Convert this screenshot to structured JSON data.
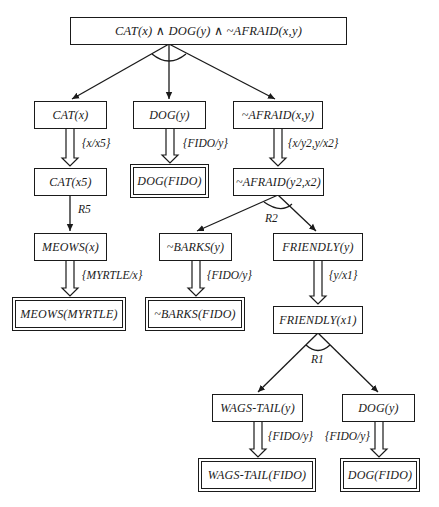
{
  "diagram": {
    "type": "AND/OR proof tree",
    "root": {
      "label": "CAT(x) ∧ DOG(y) ∧ ~AFRAID(x,y)"
    },
    "nodes": {
      "cat_x": "CAT(x)",
      "dog_y": "DOG(y)",
      "afraid_xy": "~AFRAID(x,y)",
      "cat_x5": "CAT(x5)",
      "dog_fido": "DOG(FIDO)",
      "afraid_y2x2": "~AFRAID(y2,x2)",
      "meows_x": "MEOWS(x)",
      "barks_y": "~BARKS(y)",
      "friendly_y": "FRIENDLY(y)",
      "meows_myrtle": "MEOWS(MYRTLE)",
      "barks_fido": "~BARKS(FIDO)",
      "friendly_x1": "FRIENDLY(x1)",
      "wagstail_y": "WAGS-TAIL(y)",
      "dog_y2": "DOG(y)",
      "wagstail_fido": "WAGS-TAIL(FIDO)",
      "dog_fido2": "DOG(FIDO)"
    },
    "substitutions": {
      "x_x5": "{x/x5}",
      "fido_y_1": "{FIDO/y}",
      "x_y2_y_x2": "{x/y2,y/x2}",
      "myrtle_x": "{MYRTLE/x}",
      "fido_y_2": "{FIDO/y}",
      "y_x1": "{y/x1}",
      "fido_y_3": "{FIDO/y}",
      "fido_y_4": "{FIDO/y}"
    },
    "rules": {
      "r5": "R5",
      "r2": "R2",
      "r1": "R1"
    }
  }
}
